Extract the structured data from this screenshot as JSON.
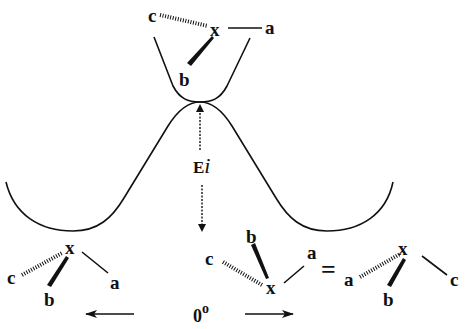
{
  "diagram": {
    "title": "",
    "colors": {
      "line": "#111111",
      "background": "#ffffff"
    },
    "energy_label": {
      "main": "E",
      "subscript": "i"
    },
    "angle_label": {
      "value": "0",
      "unit": "o"
    },
    "equals": "=",
    "molecules": {
      "top": {
        "center": "x",
        "a": "a",
        "b": "b",
        "c": "c"
      },
      "bottom_left": {
        "center": "x",
        "a": "a",
        "b": "b",
        "c": "c"
      },
      "bottom_middle": {
        "center": "x",
        "a": "a",
        "b": "b",
        "c": "c"
      },
      "bottom_right": {
        "center": "x",
        "a": "a",
        "b": "b",
        "c": "c"
      }
    },
    "arrows": {
      "left": "left-arrow",
      "right": "right-arrow",
      "energy_up": "dashed-up-arrow",
      "energy_down": "dashed-down-arrow"
    }
  }
}
